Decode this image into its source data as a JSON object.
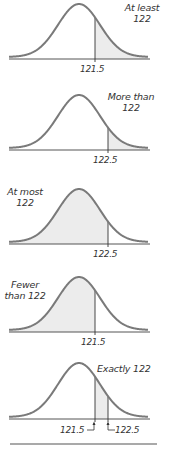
{
  "colors": {
    "curve": "#7a7a7a",
    "shade": "#ececec",
    "axis": "#555555",
    "cutoff": "#333333",
    "text": "#333333"
  },
  "panels": [
    {
      "id": "at-least",
      "label_line1": "At least",
      "label_line2": "122",
      "cutoff_labels": [
        "121.5"
      ],
      "shade": "right",
      "cutoffs": [
        121.5
      ]
    },
    {
      "id": "more-than",
      "label_line1": "More than",
      "label_line2": "122",
      "cutoff_labels": [
        "122.5"
      ],
      "shade": "right",
      "cutoffs": [
        122.5
      ]
    },
    {
      "id": "at-most",
      "label_line1": "At most",
      "label_line2": "122",
      "cutoff_labels": [
        "122.5"
      ],
      "shade": "left",
      "cutoffs": [
        122.5
      ]
    },
    {
      "id": "fewer-than",
      "label_line1": "Fewer",
      "label_line2": "than 122",
      "cutoff_labels": [
        "121.5"
      ],
      "shade": "left",
      "cutoffs": [
        121.5
      ]
    },
    {
      "id": "exactly",
      "label_line1": "Exactly 122",
      "label_line2": "",
      "cutoff_labels": [
        "121.5",
        "122.5"
      ],
      "shade": "between",
      "cutoffs": [
        121.5,
        122.5
      ]
    }
  ]
}
